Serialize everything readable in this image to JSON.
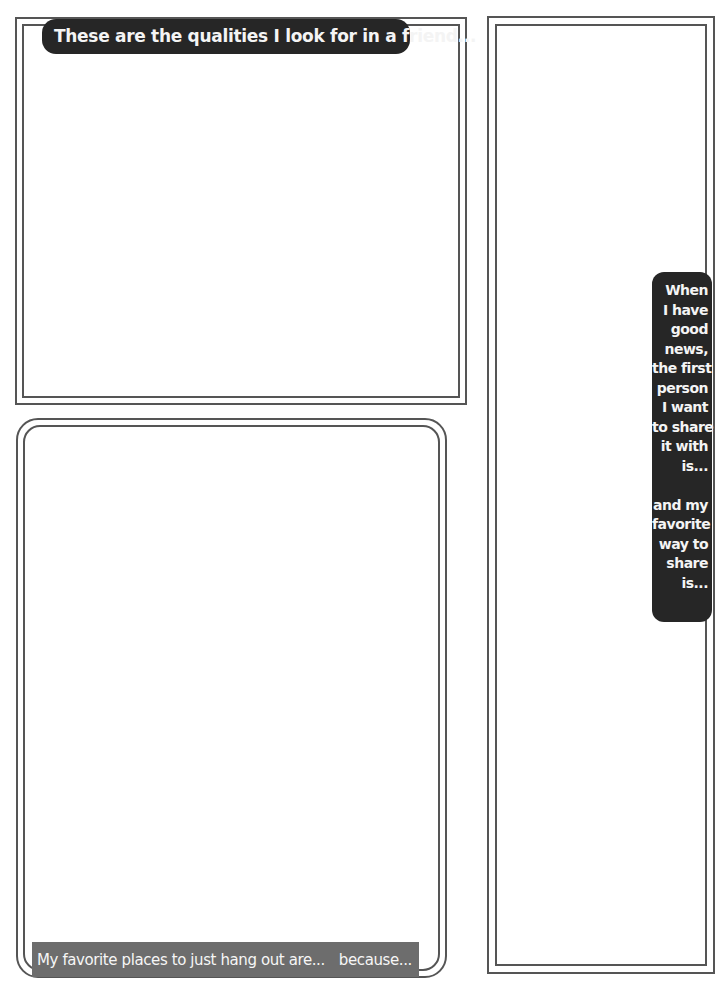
{
  "worksheet": {
    "top_left_box": {
      "label": "These are the qualities I look for in a friend..."
    },
    "bottom_left_box": {
      "label_part1": "My favorite places to just hang out are...",
      "label_part2": "because..."
    },
    "right_box": {
      "label_lines_1": [
        "When",
        "I have",
        "good",
        "news,",
        "the first",
        "person",
        "I want",
        "to share",
        "it with",
        "is..."
      ],
      "label_lines_2": [
        "and my",
        "favorite",
        "way to",
        "share",
        "is..."
      ]
    }
  },
  "colors": {
    "label_dark": "#262626",
    "label_gray": "#6d6d6d",
    "frame_line": "#555555",
    "background": "#ffffff"
  }
}
